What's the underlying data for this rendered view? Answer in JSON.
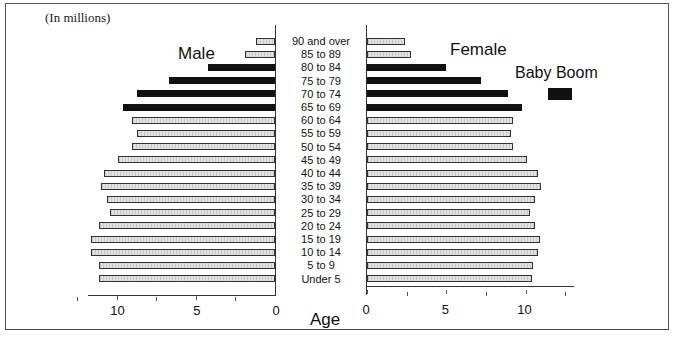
{
  "chart_data": {
    "type": "bar",
    "subtype": "population-pyramid",
    "note": "(In millions)",
    "xlabel": "Age",
    "categories": [
      "90 and over",
      "85 to 89",
      "80 to 84",
      "75 to 79",
      "70 to 74",
      "65 to 69",
      "60 to 64",
      "55 to 59",
      "50 to 54",
      "45 to 49",
      "40 to 44",
      "35 to 39",
      "30 to 34",
      "25 to 29",
      "20 to 24",
      "15 to 19",
      "10 to 14",
      "5 to 9",
      "Under 5"
    ],
    "series": [
      {
        "name": "Male",
        "values": [
          1.2,
          1.9,
          4.2,
          6.7,
          8.7,
          9.6,
          9.0,
          8.7,
          9.0,
          9.9,
          10.8,
          11.0,
          10.6,
          10.4,
          11.1,
          11.6,
          11.6,
          11.1,
          11.1
        ]
      },
      {
        "name": "Female",
        "values": [
          2.4,
          2.8,
          5.0,
          7.2,
          8.9,
          9.8,
          9.2,
          9.1,
          9.2,
          10.1,
          10.8,
          11.0,
          10.6,
          10.3,
          10.6,
          10.9,
          10.8,
          10.5,
          10.4
        ]
      }
    ],
    "highlight": {
      "label": "Baby Boom",
      "categories": [
        "80 to 84",
        "75 to 79",
        "70 to 74",
        "65 to 69"
      ],
      "color": "#111111"
    },
    "male_axis": {
      "ticks": [
        10,
        5,
        0
      ],
      "range": [
        12.5,
        0
      ]
    },
    "female_axis": {
      "ticks": [
        0,
        5,
        10
      ],
      "range": [
        0,
        12.5
      ]
    },
    "colors": {
      "normal_fill": "#e2e2e2",
      "boom_fill": "#111111",
      "border": "#333333"
    },
    "grid": false,
    "legend_position": "upper-right"
  },
  "labels": {
    "note": "(In millions)",
    "male": "Male",
    "female": "Female",
    "legend": "Baby Boom",
    "age": "Age",
    "male_ticks": [
      "10",
      "5",
      "0"
    ],
    "female_ticks": [
      "0",
      "5",
      "10"
    ]
  }
}
